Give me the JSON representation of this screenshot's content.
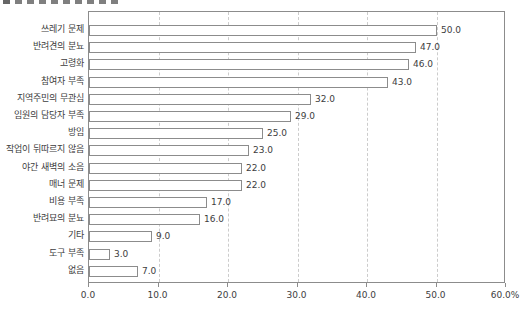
{
  "page": {
    "background": "#ffffff"
  },
  "chart_data": {
    "type": "bar",
    "orientation": "horizontal",
    "title": "",
    "xlabel": "",
    "ylabel": "",
    "categories": [
      "쓰레기 문제",
      "반려견의 분뇨",
      "고령화",
      "참여자 부족",
      "지역주민의 무관심",
      "임원의 담당자 부족",
      "방임",
      "작업이 뒤따르지 않음",
      "야간 새벽의 소음",
      "매너 문제",
      "비용 부족",
      "반려묘의 분뇨",
      "기타",
      "도구 부족",
      "없음"
    ],
    "values": [
      50.0,
      47.0,
      46.0,
      43.0,
      32.0,
      29.0,
      25.0,
      23.0,
      22.0,
      22.0,
      17.0,
      16.0,
      9.0,
      3.0,
      7.0
    ],
    "value_labels": [
      "50.0",
      "47.0",
      "46.0",
      "43.0",
      "32.0",
      "29.0",
      "25.0",
      "23.0",
      "22.0",
      "22.0",
      "17.0",
      "16.0",
      "9.0",
      "3.0",
      "7.0"
    ],
    "xlim": [
      0,
      60
    ],
    "x_tick_values": [
      0,
      10,
      20,
      30,
      40,
      50,
      60
    ],
    "x_tick_labels": [
      "0.0",
      "10.0",
      "20.0",
      "30.0",
      "40.0",
      "50.0",
      "60.0%"
    ],
    "gridlines": {
      "style": "vertical-dashed",
      "at": [
        10,
        20,
        30,
        40,
        50
      ]
    },
    "legend": "none",
    "colors": {
      "bar_fill": "#ffffff",
      "bar_border": "#8c8c8c",
      "gridline": "#cccccc",
      "frame": "#8c8c8c",
      "text": "#3d3d3d"
    }
  }
}
